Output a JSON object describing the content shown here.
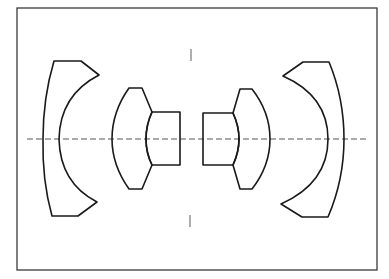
{
  "diagram": {
    "type": "lens-cross-section",
    "colors": {
      "background": "#ffffff",
      "lens_stroke": "#1a1a1a",
      "frame_stroke": "#3a3a3a",
      "axis_stroke": "#555555"
    },
    "elements": [
      {
        "id": "front-meniscus",
        "label": "Front negative meniscus element"
      },
      {
        "id": "front-inner-element",
        "label": "Front inner convex element"
      },
      {
        "id": "front-cemented-element",
        "label": "Front cemented element"
      },
      {
        "id": "rear-cemented-element",
        "label": "Rear cemented element"
      },
      {
        "id": "rear-inner-element",
        "label": "Rear inner convex element"
      },
      {
        "id": "rear-meniscus",
        "label": "Rear negative meniscus element"
      }
    ],
    "optical_axis": "dash-dot centerline",
    "aperture_stop": "tick marks above and below center"
  }
}
